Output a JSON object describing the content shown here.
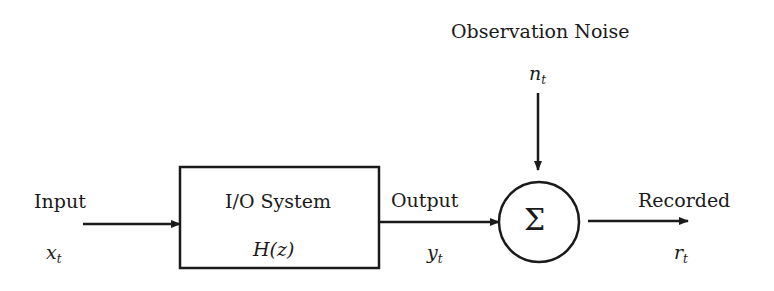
{
  "diagram": {
    "type": "block-diagram",
    "nodes": {
      "input": {
        "label": "Input",
        "symbol": "x",
        "subscript": "t"
      },
      "system": {
        "label": "I/O System",
        "transfer_function": "H(z)"
      },
      "output": {
        "label": "Output",
        "symbol": "y",
        "subscript": "t"
      },
      "noise": {
        "label": "Observation Noise",
        "symbol": "n",
        "subscript": "t"
      },
      "summer": {
        "symbol": "Σ"
      },
      "recorded": {
        "label": "Recorded",
        "symbol": "r",
        "subscript": "t"
      }
    },
    "edges": [
      {
        "from": "input",
        "to": "system"
      },
      {
        "from": "system",
        "to": "summer"
      },
      {
        "from": "noise",
        "to": "summer"
      },
      {
        "from": "summer",
        "to": "recorded"
      }
    ],
    "colors": {
      "stroke": "#1a1a1a",
      "background": "#ffffff"
    }
  }
}
